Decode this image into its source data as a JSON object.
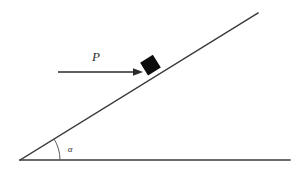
{
  "figure": {
    "type": "free-body-diagram",
    "background_color": "#ffffff",
    "line_color": "#3a3a3a",
    "block_color": "#0d0d0d",
    "arrow_color": "#2b2b2b",
    "label_color": "#2f2f2f"
  },
  "labels": {
    "force": "P",
    "angle": "α"
  },
  "geometry": {
    "ground_line": {
      "x1": 20,
      "y1": 160,
      "x2": 290,
      "y2": 160
    },
    "incline_line": {
      "x1": 20,
      "y1": 160,
      "x2": 258,
      "y2": 13
    },
    "incline_angle_degrees": 32,
    "angle_arc": {
      "cx": 20,
      "cy": 160,
      "radius": 40
    },
    "block": {
      "cx": 151,
      "cy": 66,
      "size": 15,
      "rotation_degrees": -32
    },
    "force_arrow": {
      "x1": 58,
      "y1": 72,
      "x2": 143,
      "y2": 72
    },
    "force_label_position": {
      "x": 96,
      "y": 61
    },
    "angle_label_position": {
      "x": 70,
      "y": 152
    }
  }
}
